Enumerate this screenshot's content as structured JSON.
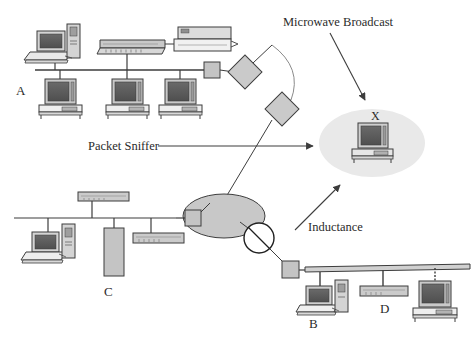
{
  "diagram": {
    "colors": {
      "background": "#ffffff",
      "line": "#3d3d3d",
      "device_fill": "#c4c4c4",
      "device_fill_light": "#d2d2d2",
      "screen_dark": "#5d5d5d",
      "cloud_center": "#c8c8c8",
      "cloud_target": "#e8e8e8",
      "text": "#2b2b2b"
    },
    "annotations": [
      {
        "id": "microwave",
        "label": "Microwave Broadcast",
        "x": 283,
        "y": 16
      },
      {
        "id": "packet-sniffer",
        "label": "Packet Sniffer",
        "x": 88,
        "y": 140
      },
      {
        "id": "inductance",
        "label": "Inductance",
        "x": 308,
        "y": 221
      }
    ],
    "node_labels": [
      {
        "id": "segment-a",
        "label": "A",
        "x": 16,
        "y": 84
      },
      {
        "id": "segment-c",
        "label": "C",
        "x": 104,
        "y": 285
      },
      {
        "id": "segment-b",
        "label": "B",
        "x": 309,
        "y": 317
      },
      {
        "id": "segment-d",
        "label": "D",
        "x": 380,
        "y": 302
      },
      {
        "id": "host-x",
        "label": "X",
        "x": 371,
        "y": 114
      }
    ],
    "segments": [
      {
        "id": "segment-a",
        "label": "A",
        "devices": [
          {
            "name": "workstation-laptop",
            "type": "laptop"
          },
          {
            "name": "tower-computer",
            "type": "tower"
          },
          {
            "name": "hub",
            "type": "hub"
          },
          {
            "name": "printer",
            "type": "printer"
          },
          {
            "name": "desktop-1",
            "type": "desktop"
          },
          {
            "name": "desktop-2",
            "type": "desktop"
          },
          {
            "name": "desktop-3",
            "type": "desktop"
          },
          {
            "name": "transceiver-tap",
            "type": "tap"
          }
        ]
      },
      {
        "id": "segment-c",
        "label": "C",
        "devices": [
          {
            "name": "hub-top",
            "type": "hub"
          },
          {
            "name": "workstation-laptop",
            "type": "laptop"
          },
          {
            "name": "tower-computer",
            "type": "tower"
          },
          {
            "name": "server-rack",
            "type": "server"
          },
          {
            "name": "hub-bottom",
            "type": "hub"
          },
          {
            "name": "transceiver-tap",
            "type": "tap"
          }
        ]
      },
      {
        "id": "segment-bd",
        "label": "B / D",
        "devices": [
          {
            "name": "workstation-laptop",
            "type": "laptop"
          },
          {
            "name": "tower-computer",
            "type": "tower"
          },
          {
            "name": "hub",
            "type": "hub"
          },
          {
            "name": "desktop",
            "type": "desktop"
          },
          {
            "name": "transceiver-tap",
            "type": "tap"
          }
        ]
      }
    ],
    "relays": [
      {
        "id": "relay-upper",
        "type": "diamond",
        "x": 245,
        "y": 72
      },
      {
        "id": "relay-lower",
        "type": "diamond",
        "x": 282,
        "y": 109
      }
    ],
    "clouds": [
      {
        "id": "network-cloud-center",
        "type": "ellipse",
        "cx": 224,
        "cy": 216,
        "rx": 40,
        "ry": 22
      },
      {
        "id": "broadcast-cloud-x",
        "type": "ellipse",
        "cx": 372,
        "cy": 143,
        "rx": 52,
        "ry": 33
      }
    ],
    "inductance_symbol": {
      "id": "inductance-coil",
      "type": "circle-slash",
      "cx": 259,
      "cy": 238,
      "r": 15
    }
  }
}
